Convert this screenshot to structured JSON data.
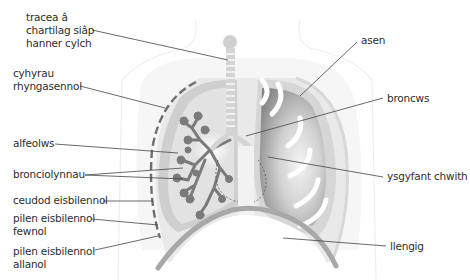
{
  "diagram": {
    "style": "grayscale anatomical illustration",
    "colors": {
      "label_text": "#2e2e2e",
      "leader_line": "#444444",
      "tissue_light": "#e4e4e4",
      "tissue_mid": "#c8c8c8",
      "lung_dark": "#8a8a8a",
      "bronchial_tree": "#7a7a7a"
    },
    "labels_left": [
      {
        "id": "trachea",
        "lines": [
          "tracea â",
          "chartilag siâp",
          "hanner cylch"
        ]
      },
      {
        "id": "intercostal-muscles",
        "lines": [
          "cyhyrau",
          "rhyngasennol"
        ]
      },
      {
        "id": "alveoli",
        "lines": [
          "alfeolws"
        ]
      },
      {
        "id": "bronchioles",
        "lines": [
          "bronciolynnau"
        ]
      },
      {
        "id": "pleural-cavity",
        "lines": [
          "ceudod eisbilennol"
        ]
      },
      {
        "id": "inner-pleural-membrane",
        "lines": [
          "pilen eisbilennol",
          "fewnol"
        ]
      },
      {
        "id": "outer-pleural-membrane",
        "lines": [
          "pilen eisbilennol",
          "allanol"
        ]
      }
    ],
    "labels_right": [
      {
        "id": "ribs",
        "lines": [
          "asen"
        ]
      },
      {
        "id": "bronchus",
        "lines": [
          "broncws"
        ]
      },
      {
        "id": "left-lung",
        "lines": [
          "ysgyfant chwith"
        ]
      },
      {
        "id": "diaphragm",
        "lines": [
          "llengig"
        ]
      }
    ]
  }
}
